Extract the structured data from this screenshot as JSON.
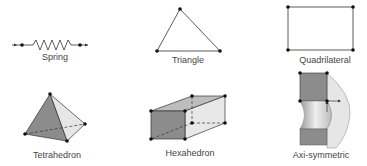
{
  "diagram": {
    "elements": [
      {
        "id": "spring",
        "label": "Spring",
        "label_x": 55,
        "label_y": 53
      },
      {
        "id": "triangle",
        "label": "Triangle",
        "label_x": 188,
        "label_y": 55
      },
      {
        "id": "quadrilateral",
        "label": "Quadrilateral",
        "label_x": 325,
        "label_y": 55
      },
      {
        "id": "tetrahedron",
        "label": "Tetrahedron",
        "label_x": 57,
        "label_y": 150
      },
      {
        "id": "hexahedron",
        "label": "Hexahedron",
        "label_x": 190,
        "label_y": 148
      },
      {
        "id": "axisymmetric",
        "label": "Axi-symmetric",
        "label_x": 321,
        "label_y": 150
      }
    ],
    "colors": {
      "line": "#333333",
      "node": "#111111",
      "face_dark": "#8c8c8c",
      "face_mid": "#bdbdbd",
      "face_light": "#e6e6e6",
      "label": "#444444"
    }
  }
}
